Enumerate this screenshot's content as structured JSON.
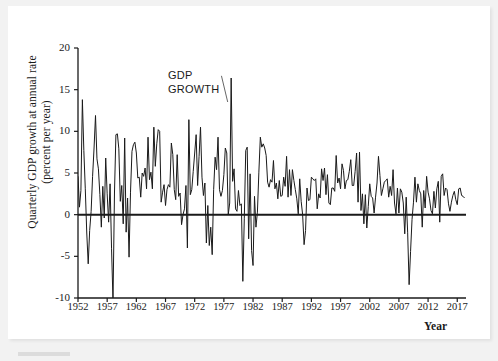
{
  "figure": {
    "annotation": {
      "line1": "GDP",
      "line2": "GROWTH"
    },
    "axis_label_y_line1": "Quarterly GDP growth at annual rate",
    "axis_label_y_line2": "(percent per year)",
    "axis_label_x": "Year"
  },
  "chart_data": {
    "type": "line",
    "title": "",
    "xlabel": "Year",
    "ylabel": "Quarterly GDP growth at annual rate (percent per year)",
    "series_name": "GDP GROWTH",
    "xlim": [
      1952,
      2018.5
    ],
    "ylim": [
      -10,
      20
    ],
    "yticks": [
      20,
      15,
      10,
      5,
      0,
      -5,
      -10
    ],
    "ytick_labels": [
      "20",
      "15",
      "10",
      "5",
      "0",
      "-5",
      "-10"
    ],
    "xticks": [
      1952,
      1957,
      1962,
      1967,
      1972,
      1977,
      1982,
      1987,
      1992,
      1997,
      2002,
      2007,
      2012,
      2017
    ],
    "xtick_labels": [
      "1952",
      "1957",
      "1962",
      "1967",
      "1972",
      "1977",
      "1982",
      "1987",
      "1992",
      "1997",
      "2002",
      "2007",
      "2012",
      "2017"
    ],
    "grid": false,
    "legend": "none",
    "zero_line": 0,
    "line_color": "#1a1a1a",
    "annotations": [
      {
        "text": "GDP GROWTH",
        "x": 1973.5,
        "y": 17.5,
        "points_to_x": 1978.0,
        "points_to_y": 14.0
      }
    ],
    "x": [
      1952.0,
      1952.25,
      1952.5,
      1952.75,
      1953.0,
      1953.25,
      1953.5,
      1953.75,
      1954.0,
      1954.25,
      1954.5,
      1954.75,
      1955.0,
      1955.25,
      1955.5,
      1955.75,
      1956.0,
      1956.25,
      1956.5,
      1956.75,
      1957.0,
      1957.25,
      1957.5,
      1957.75,
      1958.0,
      1958.25,
      1958.5,
      1958.75,
      1959.0,
      1959.25,
      1959.5,
      1959.75,
      1960.0,
      1960.25,
      1960.5,
      1960.75,
      1961.0,
      1961.25,
      1961.5,
      1961.75,
      1962.0,
      1962.25,
      1962.5,
      1962.75,
      1963.0,
      1963.25,
      1963.5,
      1963.75,
      1964.0,
      1964.25,
      1964.5,
      1964.75,
      1965.0,
      1965.25,
      1965.5,
      1965.75,
      1966.0,
      1966.25,
      1966.5,
      1966.75,
      1967.0,
      1967.25,
      1967.5,
      1967.75,
      1968.0,
      1968.25,
      1968.5,
      1968.75,
      1969.0,
      1969.25,
      1969.5,
      1969.75,
      1970.0,
      1970.25,
      1970.5,
      1970.75,
      1971.0,
      1971.25,
      1971.5,
      1971.75,
      1972.0,
      1972.25,
      1972.5,
      1972.75,
      1973.0,
      1973.25,
      1973.5,
      1973.75,
      1974.0,
      1974.25,
      1974.5,
      1974.75,
      1975.0,
      1975.25,
      1975.5,
      1975.75,
      1976.0,
      1976.25,
      1976.5,
      1976.75,
      1977.0,
      1977.25,
      1977.5,
      1977.75,
      1978.0,
      1978.25,
      1978.5,
      1978.75,
      1979.0,
      1979.25,
      1979.5,
      1979.75,
      1980.0,
      1980.25,
      1980.5,
      1980.75,
      1981.0,
      1981.25,
      1981.5,
      1981.75,
      1982.0,
      1982.25,
      1982.5,
      1982.75,
      1983.0,
      1983.25,
      1983.5,
      1983.75,
      1984.0,
      1984.25,
      1984.5,
      1984.75,
      1985.0,
      1985.25,
      1985.5,
      1985.75,
      1986.0,
      1986.25,
      1986.5,
      1986.75,
      1987.0,
      1987.25,
      1987.5,
      1987.75,
      1988.0,
      1988.25,
      1988.5,
      1988.75,
      1989.0,
      1989.25,
      1989.5,
      1989.75,
      1990.0,
      1990.25,
      1990.5,
      1990.75,
      1991.0,
      1991.25,
      1991.5,
      1991.75,
      1992.0,
      1992.25,
      1992.5,
      1992.75,
      1993.0,
      1993.25,
      1993.5,
      1993.75,
      1994.0,
      1994.25,
      1994.5,
      1994.75,
      1995.0,
      1995.25,
      1995.5,
      1995.75,
      1996.0,
      1996.25,
      1996.5,
      1996.75,
      1997.0,
      1997.25,
      1997.5,
      1997.75,
      1998.0,
      1998.25,
      1998.5,
      1998.75,
      1999.0,
      1999.25,
      1999.5,
      1999.75,
      2000.0,
      2000.25,
      2000.5,
      2000.75,
      2001.0,
      2001.25,
      2001.5,
      2001.75,
      2002.0,
      2002.25,
      2002.5,
      2002.75,
      2003.0,
      2003.25,
      2003.5,
      2003.75,
      2004.0,
      2004.25,
      2004.5,
      2004.75,
      2005.0,
      2005.25,
      2005.5,
      2005.75,
      2006.0,
      2006.25,
      2006.5,
      2006.75,
      2007.0,
      2007.25,
      2007.5,
      2007.75,
      2008.0,
      2008.25,
      2008.5,
      2008.75,
      2009.0,
      2009.25,
      2009.5,
      2009.75,
      2010.0,
      2010.25,
      2010.5,
      2010.75,
      2011.0,
      2011.25,
      2011.5,
      2011.75,
      2012.0,
      2012.25,
      2012.5,
      2012.75,
      2013.0,
      2013.25,
      2013.5,
      2013.75,
      2014.0,
      2014.25,
      2014.5,
      2014.75,
      2015.0,
      2015.25,
      2015.5,
      2015.75,
      2016.0,
      2016.25,
      2016.5,
      2016.75,
      2017.0,
      2017.25,
      2017.5,
      2017.75,
      2018.0,
      2018.25
    ],
    "values": [
      4.6,
      0.9,
      2.9,
      13.8,
      7.7,
      3.1,
      -2.2,
      -5.9,
      -1.9,
      0.4,
      4.6,
      8.0,
      11.9,
      6.7,
      5.5,
      2.4,
      -1.5,
      3.4,
      -0.4,
      6.8,
      2.5,
      -0.9,
      3.7,
      -4.1,
      -10.4,
      2.6,
      9.6,
      9.7,
      7.9,
      1.6,
      3.5,
      -1.1,
      9.2,
      -2.1,
      2.0,
      -5.1,
      2.7,
      7.6,
      8.4,
      8.7,
      7.4,
      4.4,
      4.5,
      2.1,
      5.0,
      4.6,
      5.6,
      3.1,
      9.3,
      4.2,
      5.1,
      3.1,
      10.5,
      5.8,
      8.5,
      10.2,
      10.0,
      1.5,
      2.7,
      3.6,
      1.1,
      3.0,
      3.6,
      3.3,
      8.6,
      7.2,
      3.0,
      1.8,
      7.2,
      2.2,
      2.6,
      -1.2,
      0.0,
      0.7,
      3.5,
      -4.0,
      11.4,
      2.4,
      3.0,
      5.2,
      7.4,
      9.6,
      3.5,
      7.0,
      10.5,
      4.5,
      2.3,
      3.8,
      -3.4,
      1.1,
      -3.7,
      -1.5,
      -4.8,
      3.0,
      6.9,
      5.4,
      9.3,
      3.0,
      2.2,
      2.9,
      4.8,
      8.0,
      7.4,
      0.0,
      1.4,
      16.4,
      4.0,
      5.5,
      0.7,
      0.4,
      2.9,
      1.1,
      1.3,
      -8.0,
      -0.5,
      7.7,
      8.1,
      -2.9,
      4.9,
      -4.3,
      -6.1,
      2.2,
      -1.5,
      0.3,
      5.1,
      9.3,
      8.1,
      8.5,
      8.0,
      7.1,
      3.9,
      3.3,
      4.2,
      3.9,
      6.5,
      3.1,
      3.8,
      1.9,
      4.1,
      2.2,
      2.3,
      4.5,
      3.4,
      7.0,
      2.1,
      5.4,
      2.3,
      5.4,
      4.1,
      3.0,
      1.9,
      0.1,
      4.3,
      1.6,
      0.0,
      -3.6,
      -1.9,
      3.2,
      1.7,
      1.8,
      4.5,
      4.3,
      4.1,
      4.3,
      0.7,
      2.5,
      2.0,
      5.5,
      4.1,
      5.6,
      2.4,
      4.8,
      1.4,
      1.2,
      3.2,
      3.2,
      2.8,
      7.1,
      3.8,
      4.4,
      3.1,
      6.1,
      5.3,
      3.1,
      4.1,
      4.2,
      5.2,
      6.6,
      3.5,
      3.5,
      5.2,
      7.4,
      1.5,
      7.5,
      0.5,
      2.5,
      -1.1,
      2.4,
      -1.6,
      1.0,
      3.7,
      2.2,
      2.0,
      0.2,
      2.1,
      3.8,
      7.0,
      4.7,
      2.3,
      3.1,
      3.9,
      4.1,
      4.3,
      2.1,
      3.4,
      2.3,
      5.4,
      1.4,
      0.1,
      3.2,
      0.2,
      3.1,
      2.7,
      1.4,
      -2.3,
      2.1,
      -2.1,
      -8.4,
      -4.4,
      -0.6,
      1.5,
      4.5,
      1.5,
      3.7,
      2.9,
      2.5,
      -1.5,
      2.9,
      0.8,
      4.6,
      2.7,
      1.9,
      0.5,
      0.1,
      2.8,
      0.8,
      3.1,
      4.0,
      -0.9,
      4.6,
      4.9,
      2.3,
      3.2,
      3.0,
      1.3,
      0.4,
      1.5,
      2.3,
      2.8,
      1.8,
      1.2,
      3.1,
      3.2,
      2.3,
      2.2,
      2.0
    ]
  }
}
